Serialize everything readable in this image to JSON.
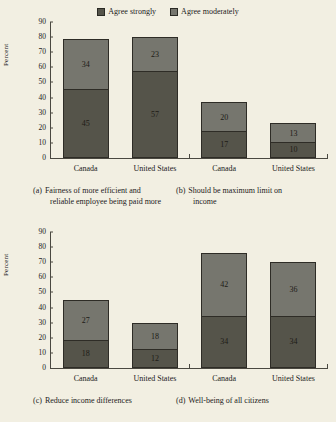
{
  "legend": {
    "items": [
      {
        "label": "Agree strongly",
        "color": "#55544a",
        "key": "strong"
      },
      {
        "label": "Agree moderately",
        "color": "#76766e",
        "key": "moderate"
      }
    ]
  },
  "axis": {
    "ylabel": "Percent",
    "yticks": [
      "90",
      "80",
      "70",
      "60",
      "50",
      "40",
      "30",
      "20",
      "10",
      "0"
    ]
  },
  "panels": [
    {
      "id": "a",
      "tag": "(a)",
      "caption_line1": "Fairness of more efficient and",
      "caption_line2": "reliable employee being paid more",
      "categories": [
        "Canada",
        "United States"
      ],
      "strong": [
        45,
        57
      ],
      "moderate": [
        34,
        23
      ]
    },
    {
      "id": "b",
      "tag": "(b)",
      "caption_line1": "Should be maximum limit on",
      "caption_line2": "income",
      "categories": [
        "Canada",
        "United States"
      ],
      "strong": [
        17,
        10
      ],
      "moderate": [
        20,
        13
      ]
    },
    {
      "id": "c",
      "tag": "(c)",
      "caption_line1": "Reduce income differences",
      "caption_line2": "",
      "categories": [
        "Canada",
        "United States"
      ],
      "strong": [
        18,
        12
      ],
      "moderate": [
        27,
        18
      ]
    },
    {
      "id": "d",
      "tag": "(d)",
      "caption_line1": "Well-being of all citizens",
      "caption_line2": "",
      "categories": [
        "Canada",
        "United States"
      ],
      "strong": [
        34,
        34
      ],
      "moderate": [
        42,
        36
      ]
    }
  ],
  "chart_data": {
    "type": "bar",
    "title": "",
    "subtitle": "",
    "xlabel": "",
    "ylabel": "Percent",
    "ylim": [
      0,
      90
    ],
    "ytick_step": 10,
    "grid": false,
    "stacked": true,
    "legend_position": "top-center",
    "legend_entries": [
      "Agree strongly",
      "Agree moderately"
    ],
    "series": [
      {
        "name": "Agree strongly",
        "color": "#55544a"
      },
      {
        "name": "Agree moderately",
        "color": "#76766e"
      }
    ],
    "panels": [
      {
        "panel": "(a) Fairness of more efficient and reliable employee being paid more",
        "categories": [
          "Canada",
          "United States"
        ],
        "values": {
          "Agree strongly": [
            45,
            57
          ],
          "Agree moderately": [
            34,
            23
          ]
        },
        "totals": [
          79,
          80
        ]
      },
      {
        "panel": "(b) Should be maximum limit on income",
        "categories": [
          "Canada",
          "United States"
        ],
        "values": {
          "Agree strongly": [
            17,
            10
          ],
          "Agree moderately": [
            20,
            13
          ]
        },
        "totals": [
          37,
          23
        ]
      },
      {
        "panel": "(c) Reduce income differences",
        "categories": [
          "Canada",
          "United States"
        ],
        "values": {
          "Agree strongly": [
            18,
            12
          ],
          "Agree moderately": [
            27,
            18
          ]
        },
        "totals": [
          45,
          30
        ]
      },
      {
        "panel": "(d) Well-being of all citizens",
        "categories": [
          "Canada",
          "United States"
        ],
        "values": {
          "Agree strongly": [
            34,
            34
          ],
          "Agree moderately": [
            42,
            36
          ]
        },
        "totals": [
          76,
          70
        ]
      }
    ]
  }
}
